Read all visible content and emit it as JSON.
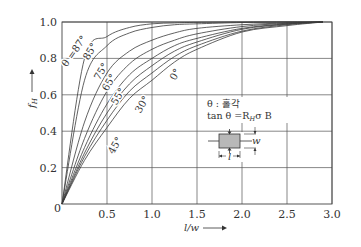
{
  "chart_data": {
    "type": "line",
    "title": "",
    "xlabel": "l/w",
    "ylabel": "f_H",
    "xlim": [
      0,
      3.0
    ],
    "ylim": [
      0,
      1.0
    ],
    "grid": true,
    "x_ticks": [
      "0.5",
      "1.0",
      "1.5",
      "2.0",
      "2.5",
      "3.0"
    ],
    "y_ticks": [
      "0.2",
      "0.4",
      "0.6",
      "0.8",
      "1.0"
    ],
    "origin_label": "0",
    "x": [
      0,
      0.25,
      0.5,
      0.75,
      1.0,
      1.25,
      1.5,
      2.0,
      2.5,
      2.9
    ],
    "series": [
      {
        "name": "θ=87°",
        "label": "θ =87°",
        "values": [
          0,
          0.8,
          0.92,
          0.97,
          0.99,
          0.995,
          0.998,
          1.0,
          1.0,
          1.0
        ]
      },
      {
        "name": "85°",
        "label": "85°",
        "values": [
          0,
          0.68,
          0.87,
          0.94,
          0.97,
          0.985,
          0.99,
          0.997,
          1.0,
          1.0
        ]
      },
      {
        "name": "75°",
        "label": "75°",
        "values": [
          0,
          0.45,
          0.72,
          0.84,
          0.9,
          0.94,
          0.965,
          0.985,
          0.995,
          1.0
        ]
      },
      {
        "name": "65°",
        "label": "65°",
        "values": [
          0,
          0.36,
          0.62,
          0.77,
          0.85,
          0.9,
          0.935,
          0.975,
          0.993,
          1.0
        ]
      },
      {
        "name": "55°",
        "label": "55°",
        "values": [
          0,
          0.31,
          0.55,
          0.71,
          0.8,
          0.87,
          0.91,
          0.965,
          0.99,
          1.0
        ]
      },
      {
        "name": "45°",
        "label": "45°",
        "values": [
          0,
          0.28,
          0.5,
          0.66,
          0.76,
          0.84,
          0.89,
          0.96,
          0.988,
          1.0
        ]
      },
      {
        "name": "30°",
        "label": "30°",
        "values": [
          0,
          0.26,
          0.46,
          0.62,
          0.72,
          0.81,
          0.87,
          0.95,
          0.985,
          1.0
        ]
      },
      {
        "name": "0°",
        "label": "0°",
        "values": [
          0,
          0.24,
          0.42,
          0.58,
          0.68,
          0.78,
          0.85,
          0.945,
          0.98,
          1.0
        ]
      }
    ],
    "annotations": [
      {
        "text": "θ : 홀각"
      },
      {
        "text": "tan θ =R_H σ B"
      }
    ],
    "inset": {
      "description": "rectangular sample with length l and width w",
      "l_label": "l",
      "w_label": "w"
    }
  },
  "labels": {
    "x_axis": "l/w",
    "y_axis_main": "f",
    "y_axis_sub": "H",
    "legend_line1": "θ : 홀각",
    "legend_line2_prefix": "tan θ =R",
    "legend_line2_sub": "H",
    "legend_line2_suffix": "σ B",
    "inset_l": "l",
    "inset_w": "w",
    "origin": "0"
  }
}
